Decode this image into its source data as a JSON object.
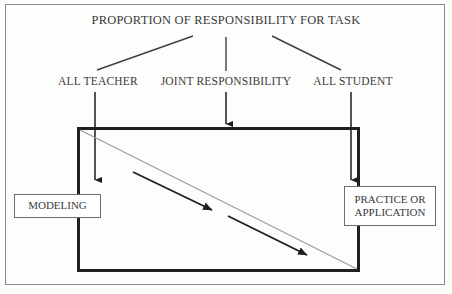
{
  "figure": {
    "title": "PROPORTION OF RESPONSIBILITY FOR TASK",
    "branch_labels": {
      "left": "ALL TEACHER",
      "center": "JOINT RESPONSIBILITY",
      "right": "ALL STUDENT"
    },
    "endpoints": {
      "left_box": "MODELING",
      "right_box_line1": "PRACTICE OR",
      "right_box_line2": "APPLICATION"
    },
    "colors": {
      "text": "#3b3b3b",
      "frame": "#1f1f1f",
      "thin_line": "#9a9a9a",
      "outer_border": "#8a8a8a",
      "background": "#fdfdfc"
    }
  }
}
